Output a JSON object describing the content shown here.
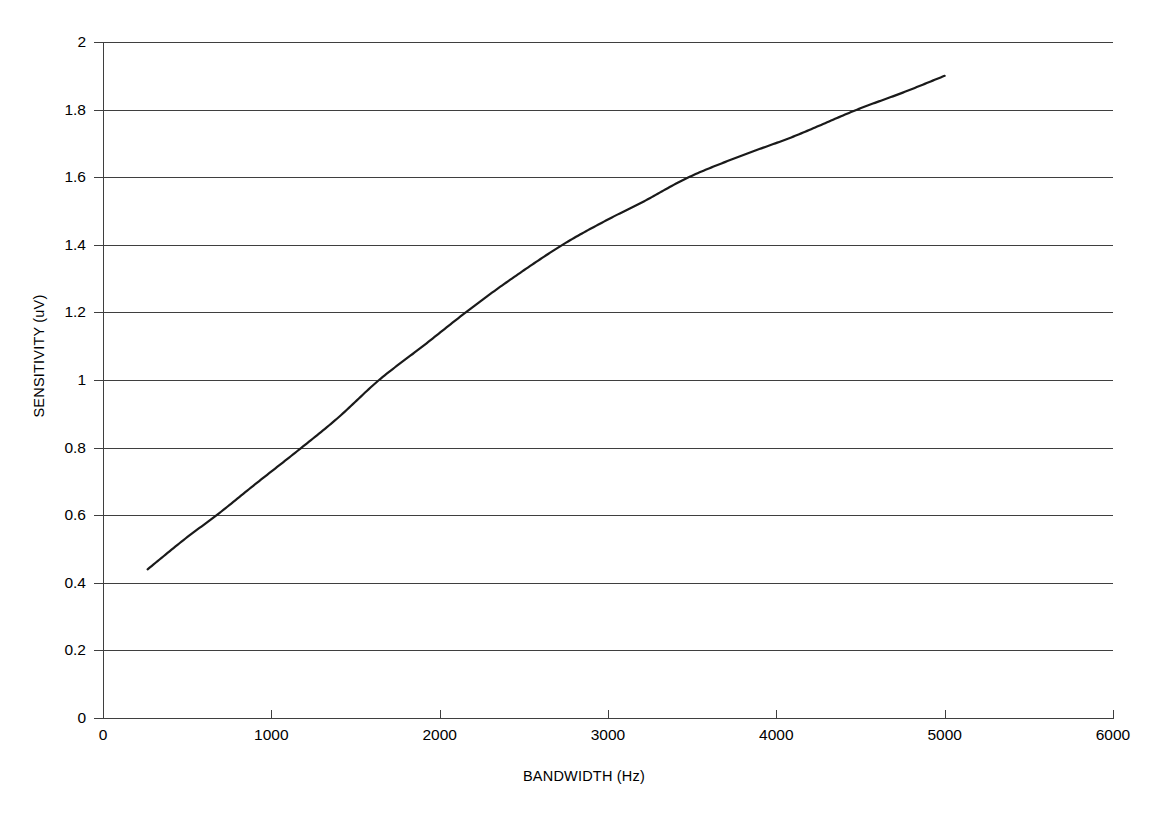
{
  "chart_data": {
    "type": "line",
    "title": "",
    "subtitle": "",
    "xlabel": "BANDWIDTH (Hz)",
    "ylabel": "SENSITIVITY (uV)",
    "xlim": [
      0,
      6000
    ],
    "ylim": [
      0,
      2
    ],
    "xticks": [
      0,
      1000,
      2000,
      3000,
      4000,
      5000,
      6000
    ],
    "xtick_labels": [
      "0",
      "1000",
      "2000",
      "3000",
      "4000",
      "5000",
      "6000"
    ],
    "yticks": [
      0,
      0.2,
      0.4,
      0.6,
      0.8,
      1,
      1.2,
      1.4,
      1.6,
      1.8,
      2
    ],
    "ytick_labels": [
      "0",
      "0.2",
      "0.4",
      "0.6",
      "0.8",
      "1",
      "1.2",
      "1.4",
      "1.6",
      "1.8",
      "2"
    ],
    "grid": "horizontal",
    "legend": "none",
    "annotations": [],
    "series": [
      {
        "name": "Sensitivity vs Bandwidth",
        "color": "#1a1a1a",
        "line_width": 2.2,
        "markers": "none",
        "x": [
          265,
          500,
          675,
          900,
          1180,
          1400,
          1640,
          1900,
          2155,
          2400,
          2730,
          3000,
          3200,
          3480,
          3800,
          4100,
          4480,
          4750,
          5000
        ],
        "y": [
          0.44,
          0.535,
          0.6,
          0.69,
          0.8,
          0.89,
          1.0,
          1.1,
          1.2,
          1.29,
          1.4,
          1.475,
          1.525,
          1.6,
          1.665,
          1.72,
          1.8,
          1.85,
          1.9
        ]
      }
    ],
    "gridline_crossings": [
      {
        "y": 0.6,
        "x": 675
      },
      {
        "y": 0.8,
        "x": 1180
      },
      {
        "y": 1.0,
        "x": 1640
      },
      {
        "y": 1.2,
        "x": 2155
      },
      {
        "y": 1.4,
        "x": 2730
      },
      {
        "y": 1.6,
        "x": 3480
      },
      {
        "y": 1.8,
        "x": 4480
      }
    ],
    "start_point": {
      "x": 265,
      "y": 0.44
    },
    "end_point": {
      "x": 5000,
      "y": 1.9
    }
  },
  "axes": {
    "x_title": "BANDWIDTH (Hz)",
    "y_title": "SENSITIVITY (uV)",
    "x_tick_labels": [
      "0",
      "1000",
      "2000",
      "3000",
      "4000",
      "5000",
      "6000"
    ],
    "y_tick_labels": [
      "2",
      "1.8",
      "1.6",
      "1.4",
      "1.2",
      "1",
      "0.8",
      "0.6",
      "0.4",
      "0.2",
      "0"
    ]
  },
  "colors": {
    "line": "#1a1a1a",
    "grid": "#3f3f3f",
    "axis": "#3f3f3f",
    "background": "#ffffff",
    "text": "#000000"
  }
}
